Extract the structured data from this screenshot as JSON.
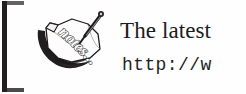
{
  "callout": {
    "type": "notes-callout",
    "bracket": {
      "name": "left-bracket-rule",
      "color": "#231f20"
    },
    "icon": {
      "name": "notes-sketch-icon",
      "label": "notes...",
      "description": "hand-drawn curled note page with pencil",
      "ink_color": "#1d1a1b"
    },
    "lines": {
      "heading": "The latest",
      "url": "http://w"
    }
  }
}
